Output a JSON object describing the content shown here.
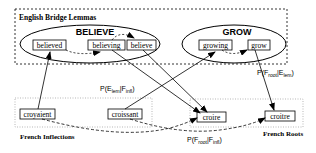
{
  "groups": {
    "english_bridge_lemmas": {
      "label": "English Bridge Lemmas"
    },
    "french_inflections": {
      "label": "French Inflections"
    },
    "french_roots": {
      "label": "French Roots"
    }
  },
  "lemmas": [
    {
      "name": "BELIEVE",
      "words": [
        "believed",
        "believing",
        "believe"
      ]
    },
    {
      "name": "GROW",
      "words": [
        "growing",
        "grow"
      ]
    }
  ],
  "french_inflections": [
    "croyaient",
    "croissant"
  ],
  "french_roots": [
    "croire",
    "croitre"
  ],
  "probabilities": {
    "lem_given_infl": {
      "prefix": "P(E",
      "sub1": "lem",
      "mid": "|F",
      "sub2": "infl",
      "suffix": ")"
    },
    "root_given_lem": {
      "prefix": "P(F",
      "sub1": "root",
      "mid": "|E",
      "sub2": "lem",
      "suffix": ")"
    },
    "root_given_infl": {
      "prefix": "P(F",
      "sub1": "root",
      "mid": "|F",
      "sub2": "infl",
      "suffix": ")"
    }
  },
  "colors": {
    "stroke": "#000000",
    "background": "#ffffff",
    "dotted_box": "#888888"
  }
}
